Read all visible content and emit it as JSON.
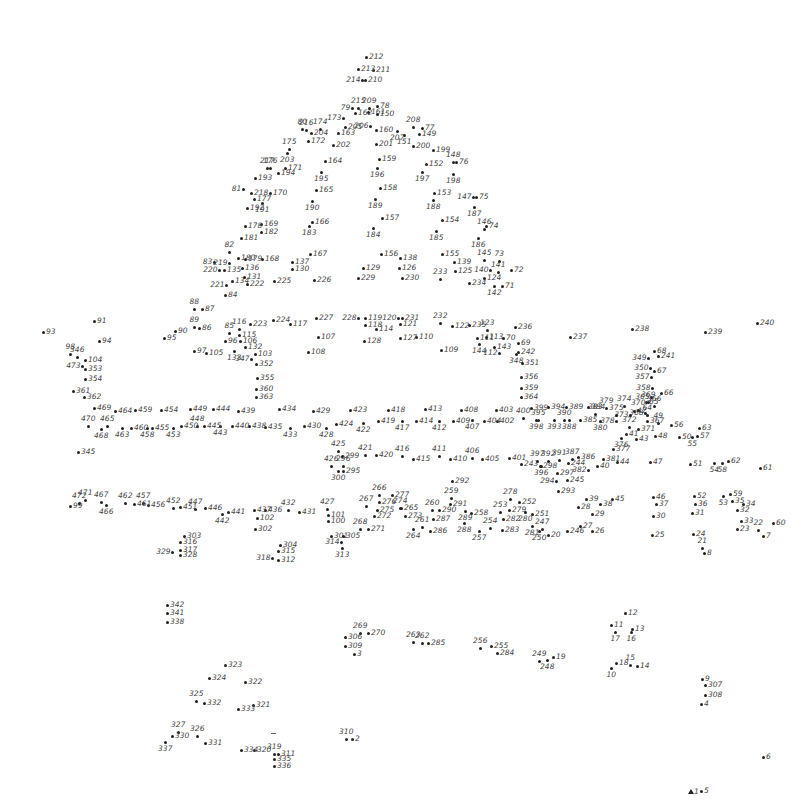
{
  "puzzle": {
    "type": "connect-the-dots",
    "total_points": 473,
    "start_marker": "triangle-start-icon",
    "start_label": "1",
    "dot_color": "#222222",
    "label_color": "#444444",
    "labels": [
      "1",
      "2",
      "3",
      "4",
      "5",
      "6",
      "7",
      "8",
      "9",
      "10",
      "11",
      "12",
      "13",
      "14",
      "15",
      "16",
      "17",
      "18",
      "19",
      "20",
      "21",
      "22",
      "23",
      "24",
      "25",
      "26",
      "27",
      "28",
      "29",
      "30",
      "31",
      "32",
      "33",
      "34",
      "35",
      "36",
      "37",
      "38",
      "39",
      "40",
      "41",
      "42",
      "43",
      "44",
      "45",
      "46",
      "47",
      "48",
      "49",
      "50",
      "51",
      "52",
      "53",
      "54",
      "55",
      "56",
      "57",
      "58",
      "59",
      "60",
      "61",
      "62",
      "63",
      "64",
      "65",
      "66",
      "67",
      "68",
      "69",
      "70",
      "71",
      "72",
      "73",
      "74",
      "75",
      "76",
      "77",
      "78",
      "79",
      "80",
      "81",
      "82",
      "83",
      "84",
      "85",
      "86",
      "87",
      "88",
      "89",
      "90",
      "91",
      "92",
      "93",
      "94",
      "95",
      "96",
      "97",
      "98",
      "99",
      "100",
      "101",
      "102",
      "103",
      "104",
      "105",
      "106",
      "107",
      "108",
      "109",
      "110",
      "111",
      "112",
      "113",
      "114",
      "115",
      "116",
      "117",
      "118",
      "119",
      "120",
      "121",
      "122",
      "123",
      "124",
      "125",
      "126",
      "127",
      "128",
      "129",
      "130",
      "131",
      "132",
      "133",
      "134",
      "135",
      "136",
      "137",
      "138",
      "139",
      "140",
      "141",
      "142",
      "143",
      "144",
      "145",
      "146",
      "147",
      "148",
      "149",
      "150",
      "151",
      "152",
      "153",
      "154",
      "155",
      "156",
      "157",
      "158",
      "159",
      "160",
      "161",
      "162",
      "163",
      "164",
      "165",
      "166",
      "167",
      "168",
      "169",
      "170",
      "171",
      "172",
      "173",
      "174",
      "175",
      "176",
      "177",
      "178",
      "179",
      "180",
      "181",
      "182",
      "183",
      "184",
      "185",
      "186",
      "187",
      "188",
      "189",
      "190",
      "191",
      "192",
      "193",
      "194",
      "195",
      "196",
      "197",
      "198",
      "199",
      "200",
      "201",
      "202",
      "203",
      "204",
      "205",
      "206",
      "207",
      "208",
      "209",
      "210",
      "211",
      "212",
      "213",
      "214",
      "215",
      "216",
      "217",
      "218",
      "219",
      "220",
      "221",
      "222",
      "223",
      "224",
      "225",
      "226",
      "227",
      "228",
      "229",
      "230",
      "231",
      "232",
      "233",
      "234",
      "235",
      "236",
      "237",
      "238",
      "239",
      "240",
      "241",
      "242",
      "243",
      "244",
      "245",
      "246",
      "247",
      "248",
      "249",
      "250",
      "251",
      "252",
      "253",
      "254",
      "255",
      "256",
      "257",
      "258",
      "259",
      "260",
      "261",
      "262",
      "263",
      "264",
      "265",
      "266",
      "267",
      "268",
      "269",
      "270",
      "271",
      "272",
      "273",
      "274",
      "275",
      "276",
      "277",
      "278",
      "279",
      "280",
      "281",
      "282",
      "283",
      "284",
      "285",
      "286",
      "287",
      "288",
      "289",
      "290",
      "291",
      "292",
      "293",
      "294",
      "295",
      "296",
      "297",
      "298",
      "299",
      "300",
      "301",
      "302",
      "303",
      "304",
      "305",
      "306",
      "307",
      "308",
      "309",
      "310",
      "311",
      "312",
      "313",
      "314",
      "315",
      "316",
      "317",
      "318",
      "319",
      "320",
      "321",
      "322",
      "323",
      "324",
      "325",
      "326",
      "327",
      "328",
      "329",
      "330",
      "331",
      "332",
      "333",
      "334",
      "335",
      "336",
      "337",
      "338",
      "339",
      "340",
      "341",
      "342",
      "343",
      "344",
      "345",
      "346",
      "347",
      "348",
      "349",
      "350",
      "351",
      "352",
      "353",
      "354",
      "355",
      "356",
      "357",
      "358",
      "359",
      "360",
      "361",
      "362",
      "363",
      "364",
      "365",
      "366",
      "367",
      "368",
      "369",
      "370",
      "371",
      "372",
      "373",
      "374",
      "375",
      "376",
      "377",
      "378",
      "379",
      "380",
      "381",
      "382",
      "383",
      "384",
      "385",
      "386",
      "387",
      "388",
      "389",
      "390",
      "391",
      "392",
      "393",
      "394",
      "395",
      "396",
      "397",
      "398",
      "399",
      "400",
      "401",
      "402",
      "403",
      "404",
      "405",
      "406",
      "407",
      "408",
      "409",
      "410",
      "411",
      "412",
      "413",
      "414",
      "415",
      "416",
      "417",
      "418",
      "419",
      "420",
      "421",
      "422",
      "423",
      "424",
      "425",
      "426",
      "427",
      "428",
      "429",
      "430",
      "431",
      "432",
      "433",
      "434",
      "435",
      "436",
      "437",
      "438",
      "439",
      "440",
      "441",
      "442",
      "443",
      "444",
      "445",
      "446",
      "447",
      "448",
      "449",
      "450",
      "451",
      "452",
      "453",
      "454",
      "455",
      "456",
      "457",
      "458",
      "459",
      "460",
      "461",
      "462",
      "463",
      "464",
      "465",
      "466",
      "467",
      "468",
      "469",
      "470",
      "471",
      "472",
      "473"
    ]
  }
}
